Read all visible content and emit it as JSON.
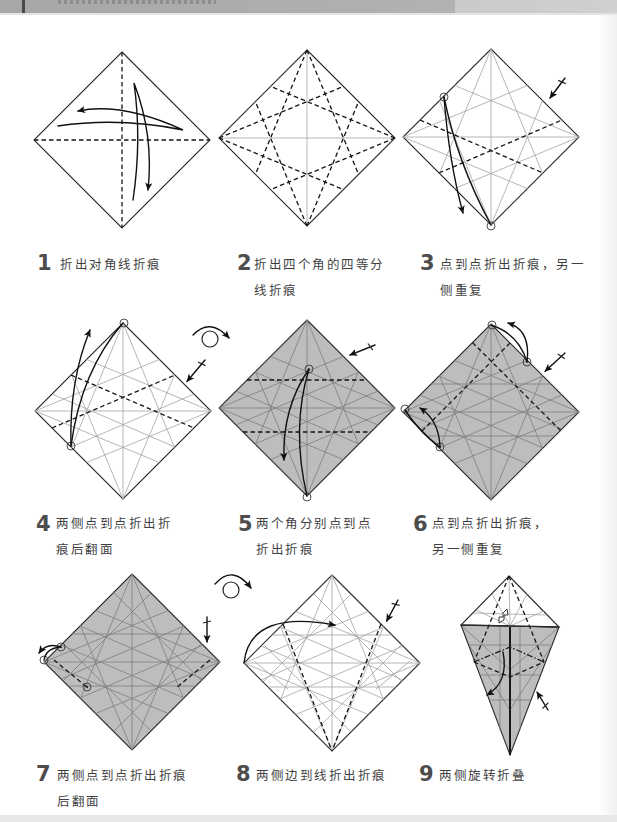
{
  "colors": {
    "paper_white": "#ffffff",
    "paper_colored": "#bdbdbd",
    "outline": "#2b2b2b",
    "crease_light": "#a3a3a3",
    "fold_line": "#151515",
    "step_number": "#4d4d4d",
    "caption_text": "#3f3f3f",
    "header_band": "#b2b2b2"
  },
  "steps": [
    {
      "number": "1",
      "caption": [
        "折出对角线折痕"
      ],
      "paper_side": "white",
      "symbols": [
        "valley-fold-line",
        "valley-fold-line",
        "fold-arrow",
        "fold-arrow"
      ]
    },
    {
      "number": "2",
      "caption": [
        "折出四个角的四等分",
        "线折痕"
      ],
      "paper_side": "white",
      "symbols": [
        "valley-fold-line x8"
      ]
    },
    {
      "number": "3",
      "caption": [
        "点到点折出折痕，另一",
        "侧重复"
      ],
      "paper_side": "white",
      "symbols": [
        "point-marker",
        "point-marker",
        "fold-arrow",
        "repeat-other-side"
      ]
    },
    {
      "number": "4",
      "caption": [
        "两侧点到点折出折",
        "痕后翻面"
      ],
      "paper_side": "white",
      "symbols": [
        "point-marker",
        "point-marker",
        "fold-arrow",
        "repeat-other-side",
        "turn-over"
      ]
    },
    {
      "number": "5",
      "caption": [
        "两个角分别点到点",
        "折出折痕"
      ],
      "paper_side": "colored",
      "symbols": [
        "point-marker",
        "point-marker",
        "fold-arrow",
        "repeat-other-side"
      ]
    },
    {
      "number": "6",
      "caption": [
        "点到点折出折痕，",
        "另一侧重复"
      ],
      "paper_side": "colored",
      "symbols": [
        "point-marker",
        "point-marker",
        "point-marker",
        "point-marker",
        "fold-arrow",
        "fold-arrow",
        "repeat-other-side"
      ]
    },
    {
      "number": "7",
      "caption": [
        "两侧点到点折出折痕",
        "后翻面"
      ],
      "paper_side": "colored",
      "symbols": [
        "point-marker",
        "point-marker",
        "point-marker",
        "fold-arrow",
        "repeat-other-side",
        "turn-over"
      ]
    },
    {
      "number": "8",
      "caption": [
        "两侧边到线折出折痕"
      ],
      "paper_side": "white",
      "symbols": [
        "fold-arrow",
        "repeat-other-side"
      ]
    },
    {
      "number": "9",
      "caption": [
        "两侧旋转折叠"
      ],
      "paper_side": "mixed",
      "symbols": [
        "valley-fold-line",
        "mountain-fold-line",
        "fold-arrow",
        "repeat-other-side",
        "push-in"
      ]
    }
  ]
}
